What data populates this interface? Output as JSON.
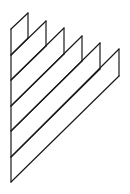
{
  "diagram": {
    "stroke_color": "#1a1a1a",
    "background": "#ffffff",
    "stroke_width": 1.2,
    "left_edge": {
      "x": 11,
      "y_top": 29,
      "y_bottom": 182
    },
    "strips": [
      {
        "left_top_y": 29,
        "left_bottom_y": 55,
        "right_x": 28,
        "right_top_y": 13,
        "right_bottom_y": 38
      },
      {
        "left_top_y": 55,
        "left_bottom_y": 80,
        "right_x": 46,
        "right_top_y": 21,
        "right_bottom_y": 46
      },
      {
        "left_top_y": 80,
        "left_bottom_y": 106,
        "right_x": 64,
        "right_top_y": 28,
        "right_bottom_y": 54
      },
      {
        "left_top_y": 106,
        "left_bottom_y": 131,
        "right_x": 82,
        "right_top_y": 36,
        "right_bottom_y": 61
      },
      {
        "left_top_y": 131,
        "left_bottom_y": 157,
        "right_x": 100,
        "right_top_y": 43,
        "right_bottom_y": 69
      },
      {
        "left_top_y": 157,
        "left_bottom_y": 182,
        "right_x": 119,
        "right_top_y": 49,
        "right_bottom_y": 76
      }
    ]
  }
}
